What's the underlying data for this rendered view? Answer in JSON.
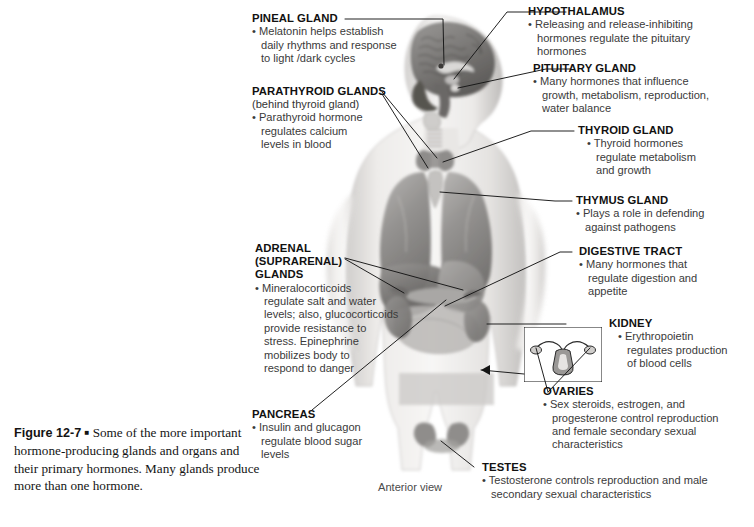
{
  "figure": {
    "number": "Figure 12-7",
    "marker": "■",
    "caption_lines": [
      "Some of the more",
      "important hormone-producing glands and",
      "organs and their primary hormones. Many",
      "glands produce more than one hormone."
    ],
    "caption_full": "Figure 12-7 ■ Some of the more important hormone-producing glands and organs and their primary hormones. Many glands produce more than one hormone.",
    "view_label": "Anterior view"
  },
  "colors": {
    "background": "#ffffff",
    "heading_text": "#111111",
    "body_text": "#3a3a3a",
    "leader_line": "#1a1a1a",
    "caption_text": "#141414",
    "artwork_light": "#e8e6e4",
    "artwork_mid": "#a8a6a4",
    "artwork_dark": "#6e6c6a",
    "artwork_darkest": "#4a4846"
  },
  "callouts": [
    {
      "id": "pineal-gland",
      "heading": "PINEAL GLAND",
      "subheading": "",
      "lines": [
        "• Melatonin helps establish",
        "daily rhythms and response",
        "to light /dark cycles"
      ]
    },
    {
      "id": "parathyroid-glands",
      "heading": "PARATHYROID GLANDS",
      "subheading": "(behind thyroid gland)",
      "lines": [
        "• Parathyroid hormone",
        "regulates calcium",
        "levels in blood"
      ]
    },
    {
      "id": "adrenal-suprarenal-glands",
      "heading": "ADRENAL",
      "heading2": "(SUPRARENAL)",
      "heading3": "GLANDS",
      "subheading": "",
      "lines": [
        "• Mineralocorticoids",
        "regulate salt and water",
        "levels; also, glucocorticoids",
        "provide resistance to",
        "stress. Epinephrine",
        "mobilizes body to",
        "respond to danger"
      ]
    },
    {
      "id": "pancreas",
      "heading": "PANCREAS",
      "subheading": "",
      "lines": [
        "• Insulin and glucagon",
        "regulate blood sugar",
        "levels"
      ]
    },
    {
      "id": "hypothalamus",
      "heading": "HYPOTHALAMUS",
      "subheading": "",
      "lines": [
        "• Releasing and release-inhibiting",
        "hormones regulate the pituitary",
        "hormones"
      ]
    },
    {
      "id": "pituitary-gland",
      "heading": "PITUITARY GLAND",
      "subheading": "",
      "lines": [
        "• Many hormones that influence",
        "growth, metabolism, reproduction,",
        "water balance"
      ]
    },
    {
      "id": "thyroid-gland",
      "heading": "THYROID GLAND",
      "subheading": "",
      "lines": [
        "• Thyroid hormones",
        "regulate metabolism",
        "and growth"
      ]
    },
    {
      "id": "thymus-gland",
      "heading": "THYMUS GLAND",
      "subheading": "",
      "lines": [
        "• Plays a role in defending",
        "against pathogens"
      ]
    },
    {
      "id": "digestive-tract",
      "heading": "DIGESTIVE TRACT",
      "subheading": "",
      "lines": [
        "• Many hormones that",
        "regulate digestion and",
        "appetite"
      ]
    },
    {
      "id": "kidney",
      "heading": "KIDNEY",
      "subheading": "",
      "lines": [
        "• Erythropoietin",
        "regulates production",
        "of blood cells"
      ]
    },
    {
      "id": "ovaries",
      "heading": "OVARIES",
      "subheading": "",
      "lines": [
        "• Sex steroids, estrogen, and",
        "progesterone control reproduction",
        "and female secondary sexual",
        "characteristics"
      ]
    },
    {
      "id": "testes",
      "heading": "TESTES",
      "subheading": "",
      "lines": [
        "• Testosterone controls reproduction and male",
        "secondary sexual characteristics"
      ]
    }
  ]
}
